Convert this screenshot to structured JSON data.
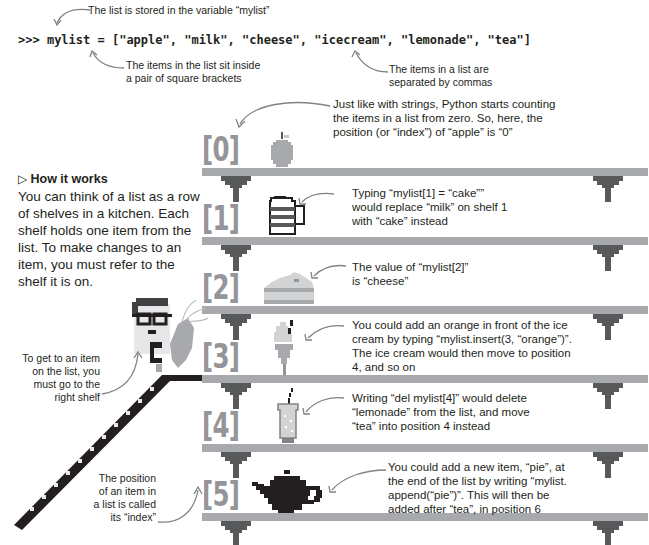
{
  "code": {
    "prompt": ">>>",
    "line": "mylist = [\"apple\", \"milk\", \"cheese\", \"icecream\", \"lemonade\", \"tea\"]"
  },
  "top_annotations": {
    "variable": "The list is stored in the variable “mylist”",
    "brackets_line1": "The items in the list sit inside",
    "brackets_line2": "a pair of square brackets",
    "commas_line1": "The items in a list are",
    "commas_line2": "separated by commas"
  },
  "how_it_works": {
    "icon": "triangle-right-icon",
    "title": "How it works",
    "lines": [
      "You can think of a list as a row",
      "of shelves in a kitchen. Each",
      "shelf holds one item from the",
      "list. To make changes to an",
      "item, you must refer to the",
      "shelf it is on."
    ]
  },
  "left_notes": {
    "shelf_note": [
      "To get to an item",
      "on the list, you",
      "must go to the",
      "right shelf"
    ],
    "index_note": [
      "The position",
      "of an item in",
      "a list is called",
      "its “index”"
    ]
  },
  "shelves": [
    {
      "index": "[0]",
      "item": "apple",
      "icon": "apple-icon",
      "note": [
        "Just like with strings, Python starts counting",
        "the items in a list from zero. So, here, the",
        "position (or “index”) of “apple” is “0”"
      ]
    },
    {
      "index": "[1]",
      "item": "milk",
      "icon": "milk-jug-icon",
      "note": [
        "Typing “mylist[1] = “cake””",
        "would replace “milk” on shelf 1",
        "with “cake” instead"
      ]
    },
    {
      "index": "[2]",
      "item": "cheese",
      "icon": "cheese-icon",
      "note": [
        "The value of “mylist[2]”",
        "is “cheese”"
      ]
    },
    {
      "index": "[3]",
      "item": "icecream",
      "icon": "ice-cream-icon",
      "note": [
        "You could add an orange in front of the ice",
        "cream by typing “mylist.insert(3, “orange”)”.",
        "The ice cream would then move to position",
        "4, and so on"
      ]
    },
    {
      "index": "[4]",
      "item": "lemonade",
      "icon": "lemonade-glass-icon",
      "note": [
        "Writing “del mylist[4]” would delete",
        "“lemonade” from the list, and move",
        "“tea” into position 4 instead"
      ]
    },
    {
      "index": "[5]",
      "item": "tea",
      "icon": "teapot-icon",
      "note": [
        "You could add a new item, “pie”, at",
        "the end of the list by writing “mylist.",
        "append(“pie”)”. This will then be",
        "added after “tea”, in position 6"
      ]
    }
  ],
  "colors": {
    "shelf": "#a7a9ac",
    "bracket": "#58595b",
    "index_text": "#939598",
    "arrow": "#808285",
    "text": "#231f20"
  }
}
